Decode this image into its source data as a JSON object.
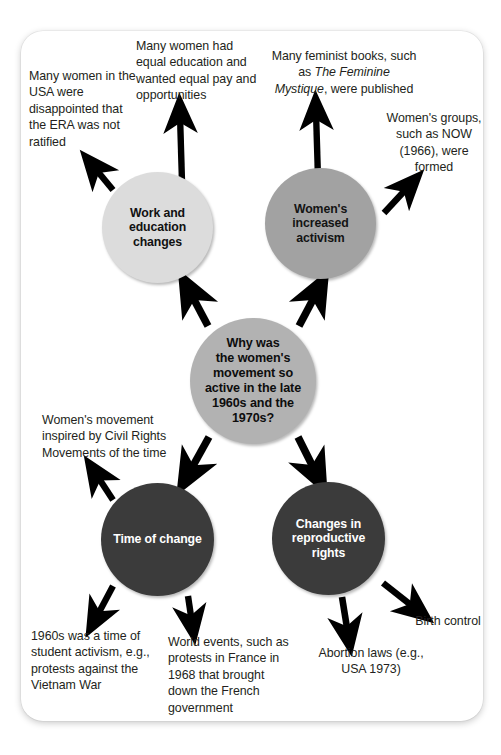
{
  "diagram": {
    "type": "mind-map",
    "colors": {
      "page_background": "#ffffff",
      "card_background": "#ffffff",
      "node_light": "#dcdcdc",
      "node_medium": "#a2a2a2",
      "node_center": "#b2b2b2",
      "node_dark": "#3b3b3b",
      "arrow": "#000000",
      "text": "#231f20"
    },
    "center_node": {
      "id": "center",
      "label": "Why was the women's movement so active in the late 1960s and the 1970s?",
      "lines": [
        "Why was",
        "the women's",
        "movement so",
        "active in the late",
        "1960s and the",
        "1970s?"
      ],
      "fill": "#b2b2b2",
      "text_color": "#0d0d0d"
    },
    "branch_nodes": [
      {
        "id": "work-education",
        "label": "Work and education changes",
        "lines": [
          "Work and",
          "education changes"
        ],
        "fill": "#dcdcdc",
        "text_color": "#111111"
      },
      {
        "id": "womens-activism",
        "label": "Women's increased activism",
        "lines": [
          "Women's increased",
          "activism"
        ],
        "fill": "#a2a2a2",
        "text_color": "#141414"
      },
      {
        "id": "time-of-change",
        "label": "Time of change",
        "lines": [
          "Time of change"
        ],
        "fill": "#3b3b3b",
        "text_color": "#ffffff"
      },
      {
        "id": "reproductive-rights",
        "label": "Changes in reproductive rights",
        "lines": [
          "Changes in",
          "reproductive",
          "rights"
        ],
        "fill": "#3b3b3b",
        "text_color": "#ffffff"
      }
    ],
    "notes": [
      {
        "id": "era",
        "text": "Many women in the USA were disappointed that the ERA was not ratified",
        "attached_to": "work-education"
      },
      {
        "id": "equal-pay",
        "text": "Many women had equal education and wanted equal pay and opportunities",
        "attached_to": "work-education"
      },
      {
        "id": "feminist-books",
        "text_before": "Many feminist books, such as ",
        "text_italic": "The Feminine Mystique",
        "text_after": ", were published",
        "text": "Many feminist books, such as The Feminine Mystique, were published",
        "attached_to": "womens-activism"
      },
      {
        "id": "now-groups",
        "text": "Women's groups, such as NOW (1966), were formed",
        "attached_to": "womens-activism"
      },
      {
        "id": "civil-rights",
        "text": "Women's movement inspired by Civil Rights Movements of the time",
        "attached_to": "time-of-change"
      },
      {
        "id": "student-activism",
        "text": "1960s was a time of student activism, e.g., protests against the Vietnam War",
        "attached_to": "time-of-change"
      },
      {
        "id": "world-events",
        "text": "World events, such as protests in France in 1968 that brought down the French government",
        "attached_to": "time-of-change"
      },
      {
        "id": "abortion-laws",
        "text": "Abortion laws (e.g., USA 1973)",
        "attached_to": "reproductive-rights"
      },
      {
        "id": "birth-control",
        "text": "Birth control",
        "attached_to": "reproductive-rights"
      }
    ]
  }
}
